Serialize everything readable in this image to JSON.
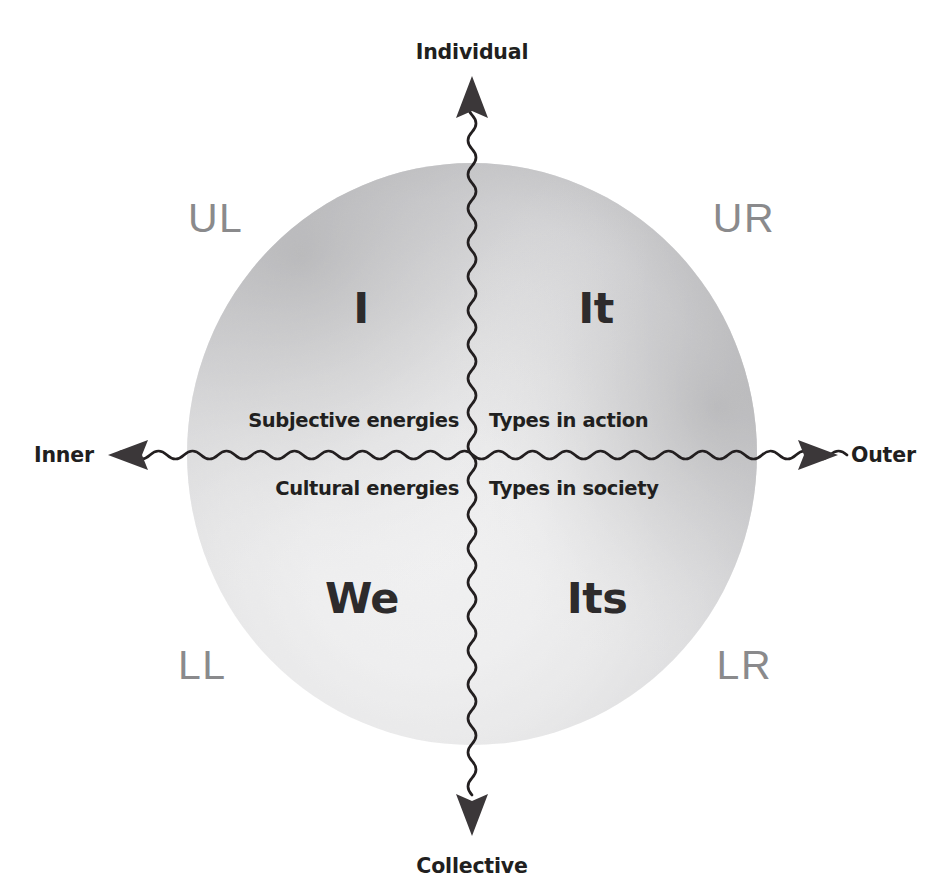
{
  "diagram": {
    "vertical_axis": {
      "top_label": "Individual",
      "bottom_label": "Collective"
    },
    "horizontal_axis": {
      "left_label": "Inner",
      "right_label": "Outer"
    },
    "quadrants": [
      {
        "code": "UL",
        "pronoun": "I",
        "descriptor": "Subjective energies",
        "position": "upper-left"
      },
      {
        "code": "UR",
        "pronoun": "It",
        "descriptor": "Types in action",
        "position": "upper-right"
      },
      {
        "code": "LL",
        "pronoun": "We",
        "descriptor": "Cultural energies",
        "position": "lower-left"
      },
      {
        "code": "LR",
        "pronoun": "Its",
        "descriptor": "Types in society",
        "position": "lower-right"
      }
    ],
    "colors": {
      "background": "#ffffff",
      "axis_line": "#231f20",
      "corner_label": "#8a8a8c",
      "body_text": "#211f20",
      "pronoun_text": "#2d2b2c",
      "sphere_highlight": "#ffffff",
      "sphere_mid": "#e2e2e3",
      "sphere_edge": "#9d9d9f"
    }
  }
}
